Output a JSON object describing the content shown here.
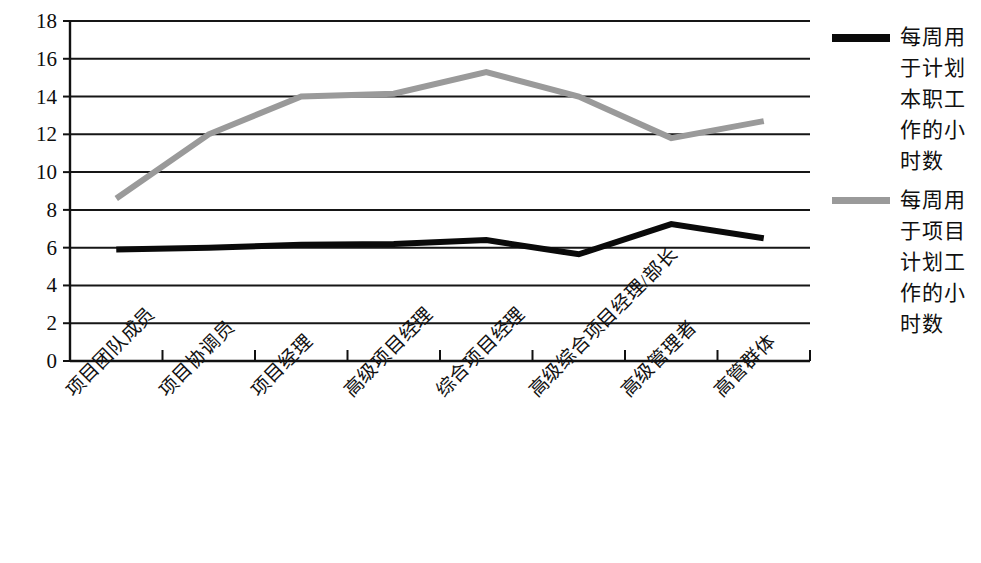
{
  "chart_data": {
    "type": "line",
    "title": "",
    "xlabel": "",
    "ylabel": "",
    "ylim": [
      0,
      18
    ],
    "yticks": [
      0,
      2,
      4,
      6,
      8,
      10,
      12,
      14,
      16,
      18
    ],
    "grid": true,
    "legend_position": "right",
    "categories": [
      "项目团队成员",
      "项目协调员",
      "项目经理",
      "高级项目经理",
      "综合项目经理",
      "高级综合项目经理/部长",
      "高级管理者",
      "高管群体"
    ],
    "series": [
      {
        "name": "每周用于计划本职工作的小时数",
        "color": "#0a0a0a",
        "width": 6,
        "values": [
          5.9,
          6.0,
          6.15,
          6.2,
          6.4,
          5.65,
          7.25,
          6.5
        ]
      },
      {
        "name": "每周用于项目计划工作的小时数",
        "color": "#9a9a9a",
        "width": 6,
        "values": [
          8.6,
          12.0,
          14.0,
          14.15,
          15.3,
          14.0,
          11.8,
          12.7
        ]
      }
    ]
  },
  "axes": {
    "y_tick_labels": [
      "18",
      "16",
      "14",
      "12",
      "10",
      "8",
      "6",
      "4",
      "2",
      "0"
    ]
  },
  "legend": {
    "entries": [
      {
        "label": "每周用于计划本职工作的小时数",
        "color": "#0a0a0a"
      },
      {
        "label": "每周用于项目计划工作的小时数",
        "color": "#9a9a9a"
      }
    ]
  }
}
